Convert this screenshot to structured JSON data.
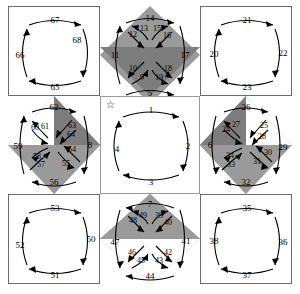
{
  "figure": {
    "type": "tiling-diagram",
    "star_marker": "☆",
    "footer_text": ""
  },
  "colors": {
    "white": "#ffffff",
    "light_gray": "#b9b9b9",
    "mid_gray": "#9a9a9a",
    "dark_gray": "#7d7d7d",
    "darkest_gray": "#6b6b6b",
    "stroke": "#000000"
  },
  "cells": {
    "top_left": {
      "name": "top-left-square",
      "kind": "plain",
      "labels": {
        "top": "67",
        "right": "68",
        "left": "66",
        "bottom": "65"
      }
    },
    "top_center": {
      "name": "top-center-star",
      "kind": "x",
      "labels": {
        "top": "14",
        "left": "11",
        "right": "17",
        "bottom": "5"
      },
      "inner": {
        "tl": "12",
        "tl2": "13",
        "tr2": "15",
        "tr": "16",
        "bl": "10",
        "bl2": "9",
        "br2": "19",
        "br": "18"
      }
    },
    "top_right": {
      "name": "top-right-square",
      "kind": "plain",
      "labels": {
        "top": "21",
        "right": "22",
        "left": "20",
        "bottom": "23"
      }
    },
    "mid_left": {
      "name": "middle-left-star",
      "kind": "x",
      "labels": {
        "top": "62",
        "left": "59",
        "right": "8",
        "bottom": "56"
      },
      "inner": {
        "tl": "60",
        "tl2": "61",
        "tr2": "63",
        "tr": "64",
        "bl": "58",
        "bl2": "57",
        "br2": "55",
        "br": "54"
      }
    },
    "center": {
      "name": "center-square",
      "kind": "center",
      "labels": {
        "top": "1",
        "right": "2",
        "left": "4",
        "bottom": "3"
      }
    },
    "mid_right": {
      "name": "middle-right-star",
      "kind": "x",
      "labels": {
        "top": "26",
        "left": "6",
        "right": "29",
        "bottom": "32"
      },
      "inner": {
        "tl": "24",
        "tl2": "27",
        "tr2": "25",
        "tr": "28",
        "bl": "34",
        "bl2": "33",
        "br2": "31",
        "br": "30"
      }
    },
    "bot_left": {
      "name": "bottom-left-square",
      "kind": "plain",
      "labels": {
        "top": "53",
        "right": "50",
        "left": "52",
        "bottom": "51"
      }
    },
    "bot_center": {
      "name": "bottom-center-star",
      "kind": "x",
      "labels": {
        "top": "7",
        "left": "47",
        "right": "41",
        "bottom": "44"
      },
      "inner": {
        "tl": "48",
        "tl2": "49",
        "tr2": "39",
        "tr": "40",
        "bl": "46",
        "bl2": "45",
        "br2": "43",
        "br": "42"
      }
    },
    "bot_right": {
      "name": "bottom-right-square",
      "kind": "plain",
      "labels": {
        "top": "35",
        "right": "36",
        "left": "38",
        "bottom": "37"
      }
    }
  }
}
